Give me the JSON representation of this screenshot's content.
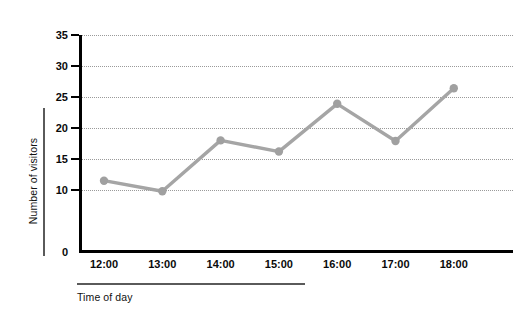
{
  "chart_data": {
    "type": "line",
    "title": "",
    "xlabel": "Time of day",
    "ylabel": "Number of visitors",
    "categories": [
      "12:00",
      "13:00",
      "14:00",
      "15:00",
      "16:00",
      "17:00",
      "18:00"
    ],
    "values": [
      11.5,
      9.8,
      18.0,
      16.2,
      23.9,
      17.9,
      26.4
    ],
    "series": [
      {
        "name": "Number of visitors",
        "values": [
          11.5,
          9.8,
          18.0,
          16.2,
          23.9,
          17.9,
          26.4
        ]
      }
    ],
    "ylim": [
      0,
      35
    ],
    "ytick_values": [
      0,
      10,
      15,
      20,
      25,
      30,
      35
    ],
    "ytick_labels": [
      "0",
      "10",
      "15",
      "20",
      "25",
      "30",
      "35"
    ],
    "gridline_values": [
      10,
      15,
      20,
      25,
      30,
      35
    ],
    "grid": "horizontal-dotted",
    "legend": "none",
    "marker": "circle",
    "line_color": "#a5a5a5",
    "marker_color": "#a0a0a0",
    "axis_color": "#000000",
    "grid_color": "#9a9a9a",
    "background": "#ffffff"
  }
}
